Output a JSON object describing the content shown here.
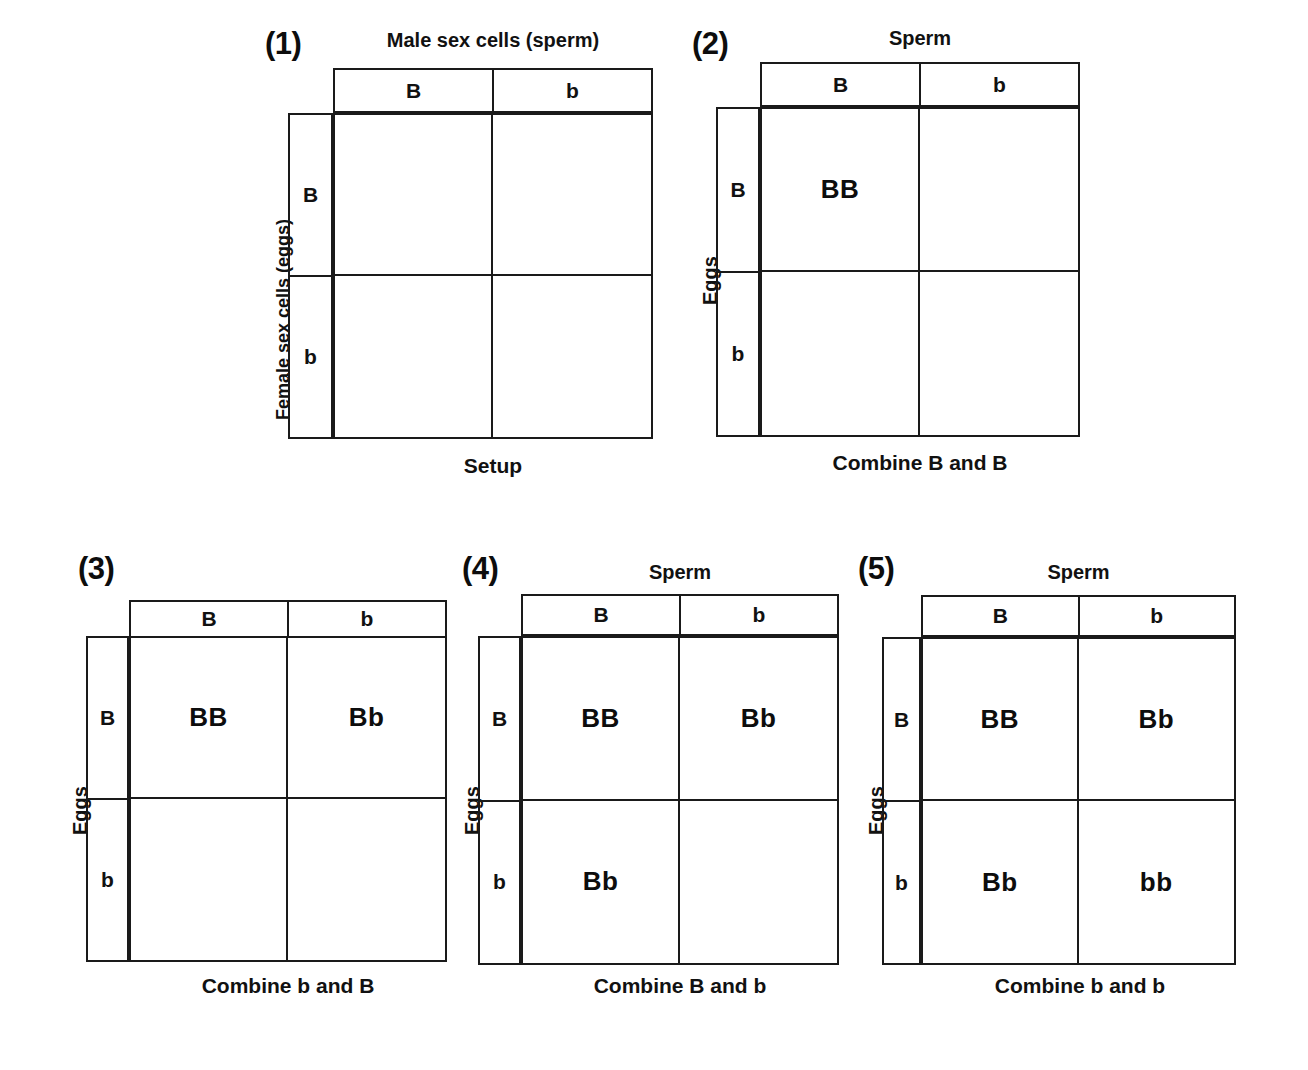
{
  "figure": {
    "allele_dominant": "B",
    "allele_recessive": "b",
    "ink_color": "#1a1a1a",
    "background_color": "#ffffff"
  },
  "panels": [
    {
      "number": "(1)",
      "top_label": "Male sex cells (sperm)",
      "side_label": "Female sex cells (eggs)",
      "bottom_label": "Setup",
      "column_headers": [
        "B",
        "b"
      ],
      "row_headers": [
        "B",
        "b"
      ],
      "cells": [
        "",
        "",
        "",
        ""
      ]
    },
    {
      "number": "(2)",
      "top_label": "Sperm",
      "side_label": "Eggs",
      "bottom_label": "Combine B and B",
      "column_headers": [
        "B",
        "b"
      ],
      "row_headers": [
        "B",
        "b"
      ],
      "cells": [
        "BB",
        "",
        "",
        ""
      ]
    },
    {
      "number": "(3)",
      "top_label": "",
      "side_label": "Eggs",
      "bottom_label": "Combine b and B",
      "column_headers": [
        "B",
        "b"
      ],
      "row_headers": [
        "B",
        "b"
      ],
      "cells": [
        "BB",
        "Bb",
        "",
        ""
      ]
    },
    {
      "number": "(4)",
      "top_label": "Sperm",
      "side_label": "Eggs",
      "bottom_label": "Combine B and b",
      "column_headers": [
        "B",
        "b"
      ],
      "row_headers": [
        "B",
        "b"
      ],
      "cells": [
        "BB",
        "Bb",
        "Bb",
        ""
      ]
    },
    {
      "number": "(5)",
      "top_label": "Sperm",
      "side_label": "Eggs",
      "bottom_label": "Combine b and b",
      "column_headers": [
        "B",
        "b"
      ],
      "row_headers": [
        "B",
        "b"
      ],
      "cells": [
        "BB",
        "Bb",
        "Bb",
        "bb"
      ]
    }
  ]
}
